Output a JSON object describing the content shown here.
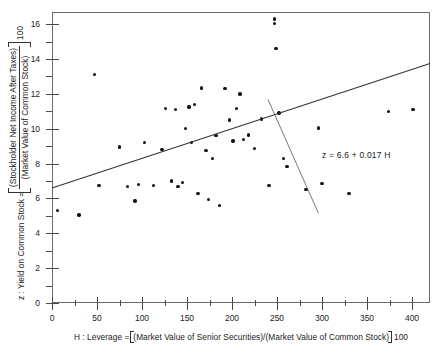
{
  "chart_data": {
    "type": "scatter",
    "title": "",
    "xlabel_parts": {
      "lead": "H : Leverage =",
      "numerator": "(Market Value of Senior Securities)/(Market Value of Common Stock)",
      "suffix": "100"
    },
    "ylabel_parts": {
      "lead": "z : Yield on Common Stock =",
      "numerator": "(Stockholder Net Income After Taxes)",
      "denominator": "(Market Value of Common Stock)",
      "suffix": "100"
    },
    "xlim": [
      0,
      420
    ],
    "ylim": [
      0,
      16.7
    ],
    "xticks": [
      0,
      50,
      100,
      150,
      200,
      250,
      300,
      350,
      400
    ],
    "xtick_labels": [
      "0",
      "50",
      "100",
      "150",
      "200",
      "250",
      "300",
      "350",
      "400"
    ],
    "xticks_minor": [
      25,
      75,
      125,
      175,
      225,
      275,
      325,
      375
    ],
    "yticks": [
      0,
      2,
      4,
      6,
      8,
      10,
      12,
      14,
      16
    ],
    "ytick_labels": [
      "0",
      "2",
      "4",
      "6",
      "8",
      "10",
      "12",
      "14",
      "16"
    ],
    "yticks_minor": [
      1,
      3,
      5,
      7,
      9,
      11,
      13,
      15
    ],
    "grid": false,
    "legend": "none",
    "fit_line": {
      "label": "z = 6.6 + 0.017 H",
      "intercept": 6.6,
      "slope": 0.017,
      "x_start": 0,
      "x_end": 420
    },
    "annotation_leader": {
      "from_x": 296,
      "from_y": 5.15,
      "to_x": 240,
      "to_y": 11.68
    },
    "points": [
      {
        "x": 6,
        "y": 5.3
      },
      {
        "x": 30,
        "y": 5.05
      },
      {
        "x": 47,
        "y": 13.1
      },
      {
        "x": 52,
        "y": 6.75
      },
      {
        "x": 75,
        "y": 8.95
      },
      {
        "x": 84,
        "y": 6.7
      },
      {
        "x": 92,
        "y": 5.85
      },
      {
        "x": 96,
        "y": 6.8
      },
      {
        "x": 103,
        "y": 9.2
      },
      {
        "x": 113,
        "y": 6.75
      },
      {
        "x": 122,
        "y": 8.8
      },
      {
        "x": 126,
        "y": 11.15
      },
      {
        "x": 133,
        "y": 7.0
      },
      {
        "x": 137,
        "y": 11.1
      },
      {
        "x": 140,
        "y": 6.7
      },
      {
        "x": 145,
        "y": 6.9
      },
      {
        "x": 148,
        "y": 10.0
      },
      {
        "x": 152,
        "y": 11.25
      },
      {
        "x": 155,
        "y": 9.2
      },
      {
        "x": 158,
        "y": 11.4
      },
      {
        "x": 162,
        "y": 6.3
      },
      {
        "x": 166,
        "y": 12.35
      },
      {
        "x": 171,
        "y": 8.75
      },
      {
        "x": 174,
        "y": 5.95
      },
      {
        "x": 178,
        "y": 8.3
      },
      {
        "x": 182,
        "y": 9.6
      },
      {
        "x": 186,
        "y": 5.6
      },
      {
        "x": 192,
        "y": 12.3
      },
      {
        "x": 197,
        "y": 10.5
      },
      {
        "x": 201,
        "y": 9.3
      },
      {
        "x": 205,
        "y": 11.15
      },
      {
        "x": 209,
        "y": 12.0
      },
      {
        "x": 213,
        "y": 9.4
      },
      {
        "x": 218,
        "y": 9.65
      },
      {
        "x": 225,
        "y": 8.85
      },
      {
        "x": 233,
        "y": 10.55
      },
      {
        "x": 241,
        "y": 6.75
      },
      {
        "x": 247,
        "y": 16.3
      },
      {
        "x": 247,
        "y": 16.05
      },
      {
        "x": 249,
        "y": 14.6
      },
      {
        "x": 252,
        "y": 10.9
      },
      {
        "x": 257,
        "y": 8.3
      },
      {
        "x": 261,
        "y": 7.85
      },
      {
        "x": 282,
        "y": 6.5
      },
      {
        "x": 296,
        "y": 10.05
      },
      {
        "x": 300,
        "y": 6.85
      },
      {
        "x": 330,
        "y": 6.3
      },
      {
        "x": 374,
        "y": 11.0
      },
      {
        "x": 401,
        "y": 11.1
      }
    ]
  }
}
